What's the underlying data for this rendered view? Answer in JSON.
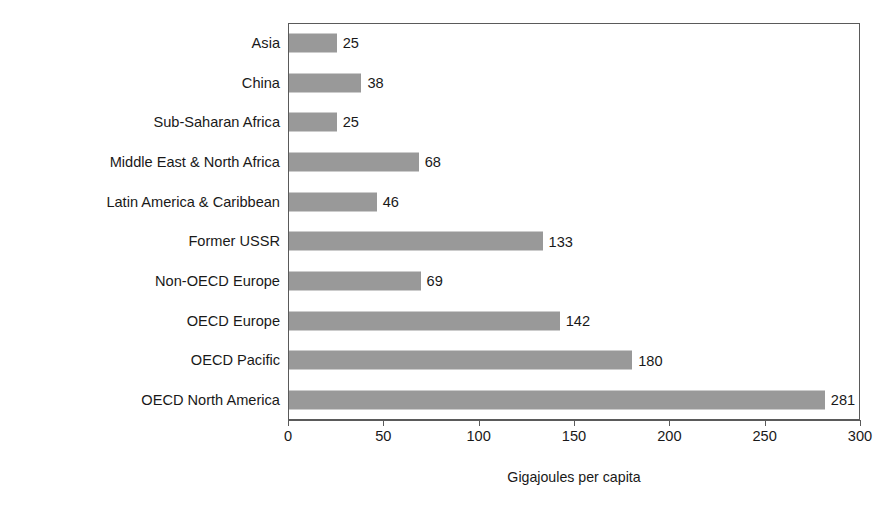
{
  "chart_data": {
    "type": "bar",
    "orientation": "horizontal",
    "title": "",
    "xlabel": "Gigajoules per capita",
    "ylabel": "",
    "xlim": [
      0,
      300
    ],
    "xticks": [
      0,
      50,
      100,
      150,
      200,
      250,
      300
    ],
    "xtick_labels": [
      "0",
      "50",
      "100",
      "150",
      "200",
      "250",
      "300"
    ],
    "grid": false,
    "legend": null,
    "bar_color": "#999999",
    "axis_color": "#5a5a5a",
    "categories": [
      "Asia",
      "China",
      "Sub-Saharan Africa",
      "Middle East & North Africa",
      "Latin America & Caribbean",
      "Former USSR",
      "Non-OECD Europe",
      "OECD Europe",
      "OECD Pacific",
      "OECD North America"
    ],
    "values": [
      25,
      38,
      25,
      68,
      46,
      133,
      69,
      142,
      180,
      281
    ],
    "data_labels": [
      "25",
      "38",
      "25",
      "68",
      "46",
      "133",
      "69",
      "142",
      "180",
      "281"
    ]
  }
}
